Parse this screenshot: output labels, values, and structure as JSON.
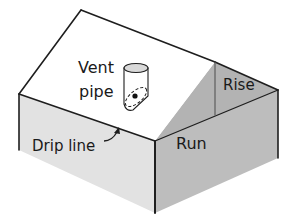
{
  "figure": {
    "type": "isometric house roof diagram",
    "colors": {
      "background": "#ffffff",
      "roof_top": "#ffffff",
      "left_wall": "#e2e2e2",
      "front_gable_wall": "#bdbdbd",
      "gable_triangle": "#b0b0b0",
      "stroke": "#1e1e1e"
    }
  },
  "labels": {
    "vent_line1": "Vent",
    "vent_line2": "pipe",
    "rise": "Rise",
    "run": "Run",
    "drip_line": "Drip line"
  }
}
